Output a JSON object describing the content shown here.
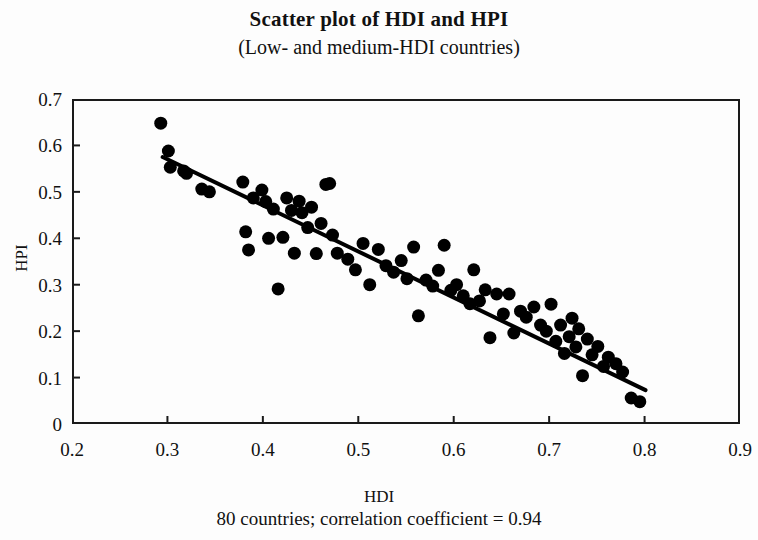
{
  "figure": {
    "title": "Scatter plot of HDI and HPI",
    "subtitle": "(Low- and medium-HDI countries)",
    "caption": "80 countries; correlation coefficient = 0.94"
  },
  "chart_data": {
    "type": "scatter",
    "title": "Scatter plot of HDI and HPI",
    "subtitle": "(Low- and medium-HDI countries)",
    "xlabel": "HDI",
    "ylabel": "HPI",
    "xlim": [
      0.2,
      0.9
    ],
    "ylim": [
      0,
      0.7
    ],
    "xticks": [
      0.2,
      0.3,
      0.4,
      0.5,
      0.6,
      0.7,
      0.8,
      0.9
    ],
    "xtick_labels": [
      "0.2",
      "0.3",
      "0.4",
      "0.5",
      "0.6",
      "0.7",
      "0.8",
      "0.9"
    ],
    "yticks": [
      0,
      0.1,
      0.2,
      0.3,
      0.4,
      0.5,
      0.6,
      0.7
    ],
    "ytick_labels": [
      "0",
      "0.1",
      "0.2",
      "0.3",
      "0.4",
      "0.5",
      "0.6",
      "0.7"
    ],
    "grid": false,
    "legend": false,
    "marker": {
      "shape": "circle",
      "color": "#000000",
      "size_px": 13
    },
    "n_points": 80,
    "correlation_coefficient": 0.94,
    "trendline": {
      "type": "linear",
      "color": "#000000",
      "width_px": 4,
      "x_start": 0.295,
      "y_start": 0.575,
      "x_end": 0.801,
      "y_end": 0.073
    },
    "points": [
      [
        0.293,
        0.648
      ],
      [
        0.301,
        0.588
      ],
      [
        0.303,
        0.553
      ],
      [
        0.317,
        0.545
      ],
      [
        0.32,
        0.54
      ],
      [
        0.336,
        0.506
      ],
      [
        0.344,
        0.5
      ],
      [
        0.379,
        0.521
      ],
      [
        0.382,
        0.414
      ],
      [
        0.385,
        0.375
      ],
      [
        0.39,
        0.487
      ],
      [
        0.399,
        0.504
      ],
      [
        0.403,
        0.479
      ],
      [
        0.406,
        0.4
      ],
      [
        0.411,
        0.463
      ],
      [
        0.416,
        0.291
      ],
      [
        0.421,
        0.402
      ],
      [
        0.425,
        0.487
      ],
      [
        0.43,
        0.46
      ],
      [
        0.433,
        0.368
      ],
      [
        0.438,
        0.48
      ],
      [
        0.441,
        0.455
      ],
      [
        0.447,
        0.423
      ],
      [
        0.451,
        0.467
      ],
      [
        0.456,
        0.367
      ],
      [
        0.461,
        0.432
      ],
      [
        0.466,
        0.516
      ],
      [
        0.47,
        0.518
      ],
      [
        0.473,
        0.407
      ],
      [
        0.478,
        0.368
      ],
      [
        0.489,
        0.355
      ],
      [
        0.497,
        0.332
      ],
      [
        0.505,
        0.389
      ],
      [
        0.512,
        0.3
      ],
      [
        0.521,
        0.376
      ],
      [
        0.529,
        0.341
      ],
      [
        0.537,
        0.327
      ],
      [
        0.545,
        0.352
      ],
      [
        0.551,
        0.313
      ],
      [
        0.558,
        0.381
      ],
      [
        0.563,
        0.233
      ],
      [
        0.571,
        0.31
      ],
      [
        0.578,
        0.297
      ],
      [
        0.584,
        0.331
      ],
      [
        0.59,
        0.385
      ],
      [
        0.597,
        0.288
      ],
      [
        0.603,
        0.3
      ],
      [
        0.61,
        0.276
      ],
      [
        0.617,
        0.259
      ],
      [
        0.621,
        0.332
      ],
      [
        0.627,
        0.265
      ],
      [
        0.633,
        0.289
      ],
      [
        0.638,
        0.186
      ],
      [
        0.645,
        0.28
      ],
      [
        0.652,
        0.237
      ],
      [
        0.658,
        0.28
      ],
      [
        0.663,
        0.196
      ],
      [
        0.67,
        0.243
      ],
      [
        0.676,
        0.23
      ],
      [
        0.684,
        0.252
      ],
      [
        0.691,
        0.213
      ],
      [
        0.697,
        0.2
      ],
      [
        0.702,
        0.258
      ],
      [
        0.707,
        0.178
      ],
      [
        0.712,
        0.213
      ],
      [
        0.716,
        0.152
      ],
      [
        0.721,
        0.188
      ],
      [
        0.724,
        0.228
      ],
      [
        0.728,
        0.166
      ],
      [
        0.731,
        0.205
      ],
      [
        0.735,
        0.104
      ],
      [
        0.74,
        0.183
      ],
      [
        0.745,
        0.149
      ],
      [
        0.751,
        0.167
      ],
      [
        0.757,
        0.124
      ],
      [
        0.762,
        0.144
      ],
      [
        0.77,
        0.13
      ],
      [
        0.777,
        0.112
      ],
      [
        0.786,
        0.056
      ],
      [
        0.795,
        0.048
      ]
    ]
  }
}
